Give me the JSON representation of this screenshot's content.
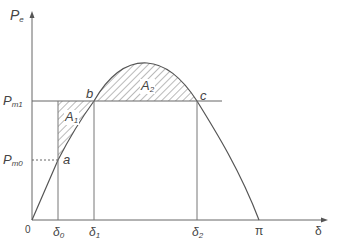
{
  "axes": {
    "y_label": "P",
    "y_label_sub": "e",
    "x_label": "δ",
    "origin_label": "0"
  },
  "y_ticks": [
    {
      "id": "pm1",
      "label": "P",
      "sub": "m1"
    },
    {
      "id": "pm0",
      "label": "P",
      "sub": "m0"
    }
  ],
  "x_ticks": [
    {
      "id": "d0",
      "label": "δ",
      "sub": "0"
    },
    {
      "id": "d1",
      "label": "δ",
      "sub": "1"
    },
    {
      "id": "d2",
      "label": "δ",
      "sub": "2"
    },
    {
      "id": "pi",
      "label": "π"
    }
  ],
  "points": {
    "a": "a",
    "b": "b",
    "c": "c"
  },
  "areas": {
    "a1": {
      "label": "A",
      "sub": "1"
    },
    "a2": {
      "label": "A",
      "sub": "2"
    }
  },
  "colors": {
    "line": "#555555",
    "hatch": "#666666"
  }
}
